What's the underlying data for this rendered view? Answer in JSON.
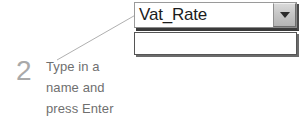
{
  "screen": {
    "title": "Name box callout",
    "background_color": "#ffffff",
    "width": 305,
    "height": 123
  },
  "name_box": {
    "value": "Vat_Rate",
    "placeholder": "",
    "dropdown_icon": "chevron-down-icon",
    "border_color": "#8a8a8a",
    "text_color": "#1c1c1c",
    "button_color": "#c6c6c6"
  },
  "dropdown_list": {
    "items": [],
    "empty_text": "",
    "border_color": "#555555",
    "background_color": "#ffffff"
  },
  "callout": {
    "step_number": "2",
    "step_number_color": "#a9a9a9",
    "text_color": "#6f6f6f",
    "lines": [
      "Type in a",
      "name and",
      "press Enter"
    ],
    "leader_line_color": "#b0b0b0"
  }
}
